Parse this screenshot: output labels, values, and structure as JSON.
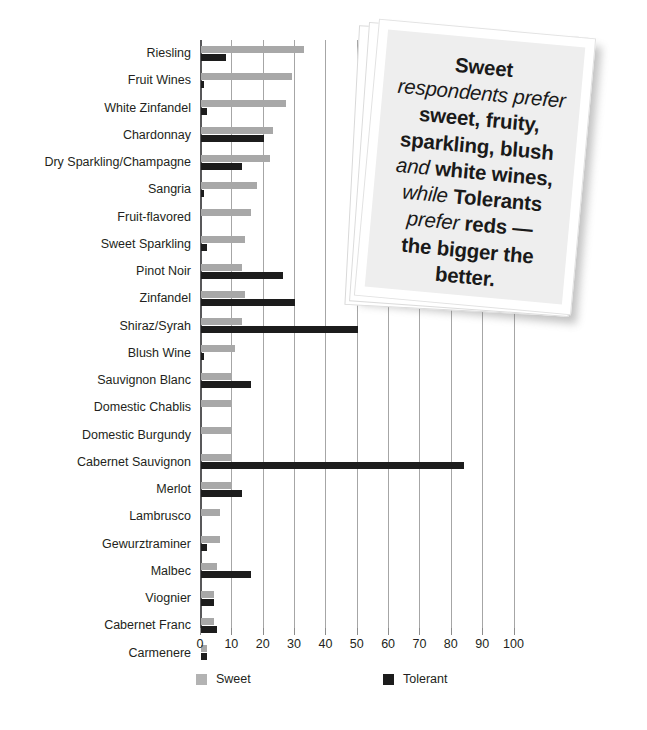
{
  "chart_data": {
    "type": "bar",
    "orientation": "horizontal",
    "title": "",
    "subtitle": "",
    "xlabel": "",
    "ylabel": "",
    "xlim": [
      0,
      100
    ],
    "xticks": [
      0,
      10,
      20,
      30,
      40,
      50,
      60,
      70,
      80,
      90,
      100
    ],
    "xtick_labels": [
      "0",
      "10",
      "20",
      "30",
      "40",
      "50",
      "60",
      "70",
      "80",
      "90",
      "100"
    ],
    "grid": "vertical",
    "legend_position": "bottom",
    "categories": [
      "Riesling",
      "Fruit Wines",
      "White Zinfandel",
      "Chardonnay",
      "Dry Sparkling/Champagne",
      "Sangria",
      "Fruit-flavored",
      "Sweet Sparkling",
      "Pinot Noir",
      "Zinfandel",
      "Shiraz/Syrah",
      "Blush Wine",
      "Sauvignon Blanc",
      "Domestic Chablis",
      "Domestic Burgundy",
      "Cabernet Sauvignon",
      "Merlot",
      "Lambrusco",
      "Gewurztraminer",
      "Malbec",
      "Viognier",
      "Cabernet Franc",
      "Carmenere"
    ],
    "series": [
      {
        "name": "Sweet",
        "color": "#a8a8a8",
        "values": [
          33,
          29,
          27,
          23,
          22,
          18,
          16,
          14,
          13,
          14,
          13,
          11,
          10,
          10,
          10,
          10,
          10,
          6,
          6,
          5,
          4,
          4,
          2
        ]
      },
      {
        "name": "Tolerant",
        "color": "#1c1c1c",
        "values": [
          8,
          1,
          2,
          20,
          13,
          1,
          0,
          2,
          26,
          30,
          50,
          1,
          16,
          0,
          0,
          84,
          13,
          0,
          2,
          16,
          4,
          5,
          2
        ]
      }
    ]
  },
  "legend": {
    "items": [
      {
        "label": "Sweet",
        "color": "#a8a8a8"
      },
      {
        "label": "Tolerant",
        "color": "#1c1c1c"
      }
    ]
  },
  "callout": {
    "lines": [
      {
        "segments": [
          {
            "text": "Sweet",
            "style": "bold"
          }
        ]
      },
      {
        "segments": [
          {
            "text": "respondents prefer",
            "style": "italic"
          }
        ]
      },
      {
        "segments": [
          {
            "text": "sweet, fruity,",
            "style": "bold"
          }
        ]
      },
      {
        "segments": [
          {
            "text": "sparkling, blush",
            "style": "bold"
          }
        ]
      },
      {
        "segments": [
          {
            "text": "and ",
            "style": "italic"
          },
          {
            "text": "white wines,",
            "style": "bold"
          }
        ]
      },
      {
        "segments": [
          {
            "text": "while ",
            "style": "italic"
          },
          {
            "text": "Tolerants",
            "style": "bold"
          }
        ]
      },
      {
        "segments": [
          {
            "text": "prefer ",
            "style": "italic"
          },
          {
            "text": "reds —",
            "style": "bold"
          }
        ]
      },
      {
        "segments": [
          {
            "text": "the bigger the",
            "style": "bold"
          }
        ]
      },
      {
        "segments": [
          {
            "text": "better.",
            "style": "bold"
          }
        ]
      }
    ]
  }
}
